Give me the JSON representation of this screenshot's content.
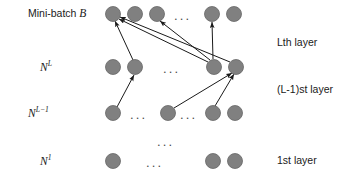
{
  "figure": {
    "canvas": {
      "width": 360,
      "height": 185,
      "background": "#ffffff"
    },
    "node_style": {
      "fill": "#808080",
      "stroke": "#666666",
      "radius": 7.5
    },
    "edge_style": {
      "stroke": "#1a1a1a",
      "width": 1.0,
      "arrowhead": "filled-triangle"
    }
  },
  "left_labels": [
    {
      "id": "mini-batch",
      "text_plain": "Mini-batch",
      "text_math": "B",
      "x": 28,
      "y": 14
    },
    {
      "id": "n-l",
      "text_base": "N",
      "text_sup": "L",
      "x": 40,
      "y": 67
    },
    {
      "id": "n-l-minus-1",
      "text_base": "N",
      "text_sup": "L−1",
      "x": 28,
      "y": 113
    },
    {
      "id": "n-1",
      "text_base": "N",
      "text_sup": "1",
      "x": 40,
      "y": 161
    }
  ],
  "right_labels": [
    {
      "id": "lth-layer",
      "text": "Lth layer",
      "x": 277,
      "y": 43
    },
    {
      "id": "l-minus-1-st-layer",
      "text": "(L-1)st layer",
      "x": 277,
      "y": 90
    },
    {
      "id": "first-layer",
      "text": "1st layer",
      "x": 277,
      "y": 161
    }
  ],
  "rows": [
    {
      "id": "row-mini-batch",
      "label_ref": "mini-batch",
      "y": 14,
      "nodes": [
        {
          "id": "mb-n1",
          "cx": 113,
          "cy": 14
        },
        {
          "id": "mb-n2",
          "cx": 135,
          "cy": 14
        },
        {
          "id": "mb-n3",
          "cx": 157,
          "cy": 14
        },
        {
          "id": "mb-n4",
          "cx": 212,
          "cy": 14
        },
        {
          "id": "mb-n5",
          "cx": 234,
          "cy": 14
        }
      ],
      "ellipses": [
        {
          "id": "mb-dots",
          "cx": 185,
          "cy": 14,
          "text": "..."
        }
      ]
    },
    {
      "id": "row-n-l",
      "label_ref": "n-l",
      "y": 67,
      "nodes": [
        {
          "id": "nl-n1",
          "cx": 113,
          "cy": 67
        },
        {
          "id": "nl-n2",
          "cx": 135,
          "cy": 67
        },
        {
          "id": "nl-n3",
          "cx": 214,
          "cy": 67
        },
        {
          "id": "nl-n4",
          "cx": 236,
          "cy": 67
        }
      ],
      "ellipses": [
        {
          "id": "nl-dots",
          "cx": 174,
          "cy": 67,
          "text": "..."
        }
      ]
    },
    {
      "id": "row-n-l-minus-1",
      "label_ref": "n-l-minus-1",
      "y": 113,
      "nodes": [
        {
          "id": "nlm-n1",
          "cx": 113,
          "cy": 113
        },
        {
          "id": "nlm-n2",
          "cx": 168,
          "cy": 113
        },
        {
          "id": "nlm-n3",
          "cx": 213,
          "cy": 113
        },
        {
          "id": "nlm-n4",
          "cx": 235,
          "cy": 113
        }
      ],
      "ellipses": [
        {
          "id": "nlm-dots-a",
          "cx": 141,
          "cy": 113,
          "text": "..."
        },
        {
          "id": "nlm-dots-b",
          "cx": 191,
          "cy": 113,
          "text": "..."
        }
      ]
    },
    {
      "id": "row-n-1",
      "label_ref": "n-1",
      "y": 161,
      "nodes": [
        {
          "id": "n1-n1",
          "cx": 113,
          "cy": 161
        },
        {
          "id": "n1-n2",
          "cx": 213,
          "cy": 161
        },
        {
          "id": "n1-n3",
          "cx": 235,
          "cy": 161
        }
      ],
      "ellipses": [
        {
          "id": "n1-dots",
          "cx": 157,
          "cy": 161,
          "text": "..."
        }
      ]
    }
  ],
  "vertical_ellipsis": {
    "id": "vertical-dots",
    "cx": 168,
    "cy": 140,
    "text": "..."
  },
  "edges": [
    {
      "id": "edge-nl2-to-mb1",
      "from": "nl-n2",
      "to": "mb-n1",
      "x1": 133,
      "y1": 60,
      "x2": 115,
      "y2": 21
    },
    {
      "id": "edge-nl3-to-mb1",
      "from": "nl-n3",
      "to": "mb-n1",
      "x1": 208,
      "y1": 62,
      "x2": 119,
      "y2": 19
    },
    {
      "id": "edge-nl3-to-mb3",
      "from": "nl-n3",
      "to": "mb-n3",
      "x1": 210,
      "y1": 60,
      "x2": 160,
      "y2": 21
    },
    {
      "id": "edge-nl3-to-mb4",
      "from": "nl-n3",
      "to": "mb-n4",
      "x1": 213,
      "y1": 59,
      "x2": 212,
      "y2": 22
    },
    {
      "id": "edge-nl4-to-mb1",
      "from": "nl-n4",
      "to": "mb-n1",
      "x1": 230,
      "y1": 62,
      "x2": 120,
      "y2": 17
    },
    {
      "id": "edge-nlm2-to-nl4",
      "from": "nlm-n2",
      "to": "nl-n4",
      "x1": 174,
      "y1": 108,
      "x2": 232,
      "y2": 73
    },
    {
      "id": "edge-nlm3-to-nl4",
      "from": "nlm-n3",
      "to": "nl-n4",
      "x1": 215,
      "y1": 106,
      "x2": 234,
      "y2": 74
    },
    {
      "id": "edge-nlm1-to-nl2",
      "from": "nlm-n1",
      "to": "nl-n2",
      "x1": 117,
      "y1": 107,
      "x2": 134,
      "y2": 75
    }
  ]
}
